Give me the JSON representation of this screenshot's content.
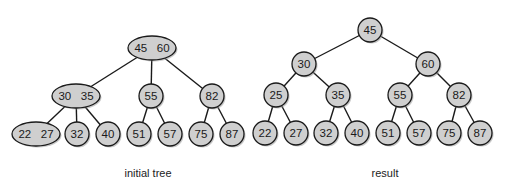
{
  "colors": {
    "node_fill": "#cfcfcf",
    "node_stroke": "#1a1a1a",
    "edge": "#1a1a1a",
    "background": "#ffffff"
  },
  "trees": [
    {
      "id": "initial",
      "caption": "initial tree",
      "caption_pos": [
        148,
        173
      ],
      "nodes": [
        {
          "id": "i_root",
          "label": "45   60",
          "shape": "ellipse",
          "x": 152,
          "y": 48,
          "rx": 24,
          "ry": 12
        },
        {
          "id": "i_3035",
          "label": "30   35",
          "shape": "ellipse",
          "x": 76,
          "y": 96,
          "rx": 24,
          "ry": 12
        },
        {
          "id": "i_55",
          "label": "55",
          "shape": "circle",
          "x": 151,
          "y": 96,
          "r": 12
        },
        {
          "id": "i_82",
          "label": "82",
          "shape": "circle",
          "x": 212,
          "y": 96,
          "r": 12
        },
        {
          "id": "i_2227",
          "label": "22   27",
          "shape": "ellipse",
          "x": 36,
          "y": 134,
          "rx": 24,
          "ry": 12
        },
        {
          "id": "i_32",
          "label": "32",
          "shape": "circle",
          "x": 77,
          "y": 134,
          "r": 12
        },
        {
          "id": "i_40",
          "label": "40",
          "shape": "circle",
          "x": 108,
          "y": 134,
          "r": 12
        },
        {
          "id": "i_51",
          "label": "51",
          "shape": "circle",
          "x": 139,
          "y": 134,
          "r": 12
        },
        {
          "id": "i_57",
          "label": "57",
          "shape": "circle",
          "x": 170,
          "y": 134,
          "r": 12
        },
        {
          "id": "i_75",
          "label": "75",
          "shape": "circle",
          "x": 201,
          "y": 134,
          "r": 12
        },
        {
          "id": "i_87",
          "label": "87",
          "shape": "circle",
          "x": 232,
          "y": 134,
          "r": 12
        }
      ],
      "edges": [
        [
          "i_root",
          "i_3035"
        ],
        [
          "i_root",
          "i_55"
        ],
        [
          "i_root",
          "i_82"
        ],
        [
          "i_3035",
          "i_2227"
        ],
        [
          "i_3035",
          "i_32"
        ],
        [
          "i_3035",
          "i_40"
        ],
        [
          "i_55",
          "i_51"
        ],
        [
          "i_55",
          "i_57"
        ],
        [
          "i_82",
          "i_75"
        ],
        [
          "i_82",
          "i_87"
        ]
      ]
    },
    {
      "id": "result",
      "caption": "result",
      "caption_pos": [
        385,
        173
      ],
      "nodes": [
        {
          "id": "r_45",
          "label": "45",
          "shape": "circle",
          "x": 370,
          "y": 30,
          "r": 12
        },
        {
          "id": "r_30",
          "label": "30",
          "shape": "circle",
          "x": 304,
          "y": 64,
          "r": 12
        },
        {
          "id": "r_60",
          "label": "60",
          "shape": "circle",
          "x": 428,
          "y": 64,
          "r": 12
        },
        {
          "id": "r_25",
          "label": "25",
          "shape": "circle",
          "x": 276,
          "y": 95,
          "r": 12
        },
        {
          "id": "r_35",
          "label": "35",
          "shape": "circle",
          "x": 338,
          "y": 95,
          "r": 12
        },
        {
          "id": "r_55",
          "label": "55",
          "shape": "circle",
          "x": 400,
          "y": 95,
          "r": 12
        },
        {
          "id": "r_82",
          "label": "82",
          "shape": "circle",
          "x": 459,
          "y": 95,
          "r": 12
        },
        {
          "id": "r_22",
          "label": "22",
          "shape": "circle",
          "x": 265,
          "y": 133,
          "r": 12
        },
        {
          "id": "r_27",
          "label": "27",
          "shape": "circle",
          "x": 296,
          "y": 133,
          "r": 12
        },
        {
          "id": "r_32",
          "label": "32",
          "shape": "circle",
          "x": 326,
          "y": 133,
          "r": 12
        },
        {
          "id": "r_40",
          "label": "40",
          "shape": "circle",
          "x": 357,
          "y": 133,
          "r": 12
        },
        {
          "id": "r_51",
          "label": "51",
          "shape": "circle",
          "x": 388,
          "y": 133,
          "r": 12
        },
        {
          "id": "r_57",
          "label": "57",
          "shape": "circle",
          "x": 419,
          "y": 133,
          "r": 12
        },
        {
          "id": "r_75",
          "label": "75",
          "shape": "circle",
          "x": 449,
          "y": 133,
          "r": 12
        },
        {
          "id": "r_87",
          "label": "87",
          "shape": "circle",
          "x": 480,
          "y": 133,
          "r": 12
        }
      ],
      "edges": [
        [
          "r_45",
          "r_30"
        ],
        [
          "r_45",
          "r_60"
        ],
        [
          "r_30",
          "r_25"
        ],
        [
          "r_30",
          "r_35"
        ],
        [
          "r_60",
          "r_55"
        ],
        [
          "r_60",
          "r_82"
        ],
        [
          "r_25",
          "r_22"
        ],
        [
          "r_25",
          "r_27"
        ],
        [
          "r_35",
          "r_32"
        ],
        [
          "r_35",
          "r_40"
        ],
        [
          "r_55",
          "r_51"
        ],
        [
          "r_55",
          "r_57"
        ],
        [
          "r_82",
          "r_75"
        ],
        [
          "r_82",
          "r_87"
        ]
      ]
    }
  ]
}
